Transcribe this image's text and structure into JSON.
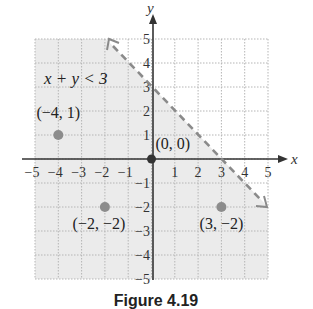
{
  "figure": {
    "caption": "Figure 4.19",
    "inequality_label": "x + y < 3",
    "axis_labels": {
      "x": "x",
      "y": "y"
    },
    "x_ticks": [
      "−5",
      "−4",
      "−3",
      "−2",
      "−1",
      "1",
      "2",
      "3",
      "4",
      "5"
    ],
    "y_ticks_pos": [
      "1",
      "2",
      "3",
      "4",
      "5"
    ],
    "y_ticks_neg": [
      "−1",
      "−2",
      "−3",
      "−4",
      "−5"
    ],
    "colors": {
      "shade": "#ebebeb",
      "grid": "#b5b5b5",
      "line": "#8a8a8a",
      "point": "#8c8c8c",
      "origin": "#333333",
      "axis": "#333333"
    }
  },
  "chart_data": {
    "type": "scatter",
    "title": "x + y < 3",
    "xlabel": "x",
    "ylabel": "y",
    "xlim": [
      -5,
      5
    ],
    "ylim": [
      -5,
      5
    ],
    "grid": true,
    "boundary_line": {
      "equation": "x + y = 3",
      "style": "dashed",
      "from": [
        -2,
        5
      ],
      "to": [
        5,
        -2
      ]
    },
    "shaded_region": "x + y < 3",
    "points": [
      {
        "label": "(−4, 1)",
        "x": -4,
        "y": 1
      },
      {
        "label": "(0, 0)",
        "x": 0,
        "y": 0
      },
      {
        "label": "(−2, −2)",
        "x": -2,
        "y": -2
      },
      {
        "label": "(3, −2)",
        "x": 3,
        "y": -2
      }
    ]
  }
}
